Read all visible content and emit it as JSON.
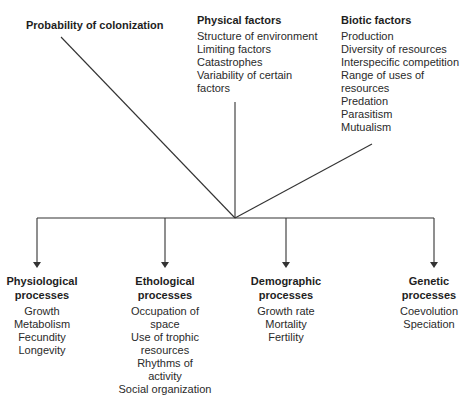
{
  "diagram": {
    "top_factors": {
      "colonization": {
        "title": "Probability of colonization"
      },
      "physical": {
        "title": "Physical factors",
        "items": [
          "Structure of environment",
          "Limiting factors",
          "Catastrophes",
          "Variability of certain",
          "factors"
        ]
      },
      "biotic": {
        "title": "Biotic factors",
        "items": [
          "Production",
          "Diversity of resources",
          "Interspecific competition",
          "Range of uses of",
          "resources",
          "Predation",
          "Parasitism",
          "Mutualism"
        ]
      }
    },
    "processes": [
      {
        "title_line1": "Physiological",
        "title_line2": "processes",
        "items": [
          "Growth",
          "Metabolism",
          "Fecundity",
          "Longevity"
        ]
      },
      {
        "title_line1": "Ethological",
        "title_line2": "processes",
        "items": [
          "Occupation of",
          "space",
          "Use of trophic",
          "resources",
          "Rhythms of",
          "activity",
          "Social organization"
        ]
      },
      {
        "title_line1": "Demographic",
        "title_line2": "processes",
        "items": [
          "Growth rate",
          "Mortality",
          "Fertility"
        ]
      },
      {
        "title_line1": "Genetic",
        "title_line2": "processes",
        "items": [
          "Coevolution",
          "Speciation"
        ]
      }
    ],
    "colors": {
      "line": "#333333",
      "text": "#2a2a2a"
    }
  }
}
